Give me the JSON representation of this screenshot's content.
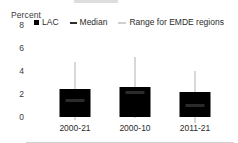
{
  "chart_data": {
    "type": "bar",
    "title": "",
    "xlabel": "",
    "ylabel": "Percent",
    "ylim": [
      0,
      8
    ],
    "yticks": [
      8,
      6,
      4,
      2,
      0
    ],
    "grid": false,
    "legend_position": "top",
    "categories": [
      "2000-21",
      "2000-10",
      "2011-21"
    ],
    "series": [
      {
        "name": "LAC",
        "type": "bar",
        "color": "#000000",
        "values": [
          2.4,
          2.65,
          2.15
        ]
      },
      {
        "name": "Median",
        "type": "marker",
        "color": "#2b2b2b",
        "values": [
          3.65,
          4.3,
          3.2
        ]
      },
      {
        "name": "Range for EMDE regions",
        "type": "range",
        "color": "#d8d8d8",
        "low": [
          2.4,
          2.65,
          2.15
        ],
        "high": [
          7.0,
          7.4,
          6.2
        ]
      }
    ]
  },
  "axis": {
    "unit_label": "Percent",
    "y_tick_labels": [
      "8",
      "6",
      "4",
      "2",
      "0"
    ],
    "x_tick_labels": [
      "2000-21",
      "2000-10",
      "2011-21"
    ]
  },
  "legend": {
    "items": [
      {
        "label": "LAC",
        "marker": "filled-square-marker",
        "color": "#000000"
      },
      {
        "label": "Median",
        "marker": "short-dash-marker",
        "color": "#2e2e2e"
      },
      {
        "label": "Range for EMDE regions",
        "marker": "thin-line-marker",
        "color": "#cfcfcf"
      }
    ]
  }
}
